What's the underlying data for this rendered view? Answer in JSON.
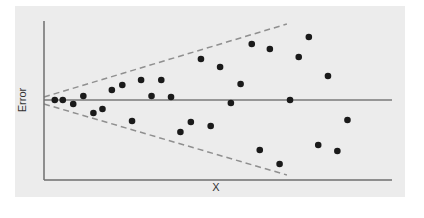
{
  "chart_data": {
    "type": "scatter",
    "title": "",
    "xlabel": "X",
    "ylabel": "Error",
    "xlim": [
      0,
      100
    ],
    "ylim": [
      -80,
      80
    ],
    "grid": false,
    "legend": null,
    "tick_labels": false,
    "reference_line": {
      "y": 0,
      "style": "solid"
    },
    "envelope": {
      "style": "dashed",
      "upper": [
        [
          0,
          3
        ],
        [
          69.8,
          76
        ]
      ],
      "lower": [
        [
          0,
          -4
        ],
        [
          69.8,
          -75
        ]
      ],
      "description": "funnel widening with X (heteroscedasticity)"
    },
    "points": [
      {
        "x": 3.1,
        "y": 0
      },
      {
        "x": 5.4,
        "y": 0
      },
      {
        "x": 8.4,
        "y": -4
      },
      {
        "x": 11.3,
        "y": 4
      },
      {
        "x": 14.2,
        "y": -13
      },
      {
        "x": 16.8,
        "y": -9
      },
      {
        "x": 19.5,
        "y": 10
      },
      {
        "x": 22.5,
        "y": 15
      },
      {
        "x": 25.3,
        "y": -21
      },
      {
        "x": 27.9,
        "y": 20
      },
      {
        "x": 30.9,
        "y": 4
      },
      {
        "x": 33.7,
        "y": 20
      },
      {
        "x": 36.5,
        "y": 3
      },
      {
        "x": 39.2,
        "y": -32
      },
      {
        "x": 42.2,
        "y": -22
      },
      {
        "x": 45.1,
        "y": 41
      },
      {
        "x": 47.9,
        "y": -26
      },
      {
        "x": 50.6,
        "y": 33
      },
      {
        "x": 53.7,
        "y": -3
      },
      {
        "x": 56.5,
        "y": 16
      },
      {
        "x": 59.7,
        "y": 56
      },
      {
        "x": 62.0,
        "y": -50
      },
      {
        "x": 64.9,
        "y": 51
      },
      {
        "x": 67.7,
        "y": -64
      },
      {
        "x": 70.7,
        "y": 0
      },
      {
        "x": 73.2,
        "y": 43
      },
      {
        "x": 76.1,
        "y": 63
      },
      {
        "x": 78.8,
        "y": -45
      },
      {
        "x": 81.6,
        "y": 24
      },
      {
        "x": 84.3,
        "y": -51
      },
      {
        "x": 87.2,
        "y": -20
      }
    ]
  },
  "colors": {
    "panel": "#ececec",
    "axis": "#6f6f6f",
    "zero_line": "#7a7a7a",
    "envelope": "#8f8f8f",
    "points": "#1a1a1a",
    "text": "#333333"
  },
  "labels": {
    "x": "X",
    "y": "Error"
  }
}
